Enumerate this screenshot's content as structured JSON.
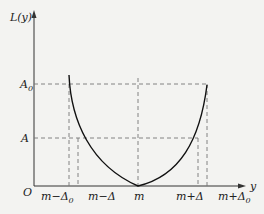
{
  "figure": {
    "y_axis_label": "L(y)",
    "x_axis_label": "y",
    "origin_label": "O",
    "y_ticks": [
      {
        "label": "A",
        "sub": "0"
      },
      {
        "label": "A",
        "sub": ""
      }
    ],
    "x_ticks": [
      {
        "label": "m−Δ",
        "sub": "0"
      },
      {
        "label": "m−Δ",
        "sub": ""
      },
      {
        "label": "m",
        "sub": ""
      },
      {
        "label": "m+Δ",
        "sub": ""
      },
      {
        "label": "m+Δ",
        "sub": "0"
      }
    ],
    "colors": {
      "curve": "#111111",
      "dashed": "#777777",
      "axis": "#333333",
      "background": "#f3f3f1"
    }
  }
}
